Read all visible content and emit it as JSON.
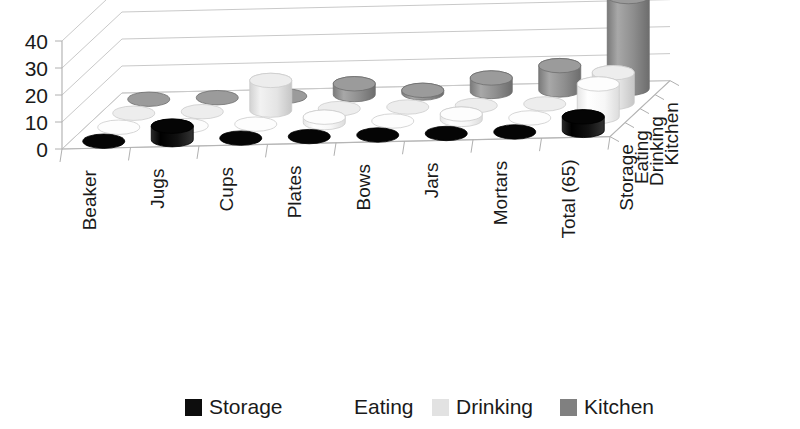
{
  "chart_data": {
    "type": "bar",
    "subtype": "3d-cylinder-grouped",
    "title": "",
    "xlabel": "",
    "ylabel": "",
    "ylim": [
      0,
      40
    ],
    "yticks": [
      0,
      10,
      20,
      30,
      40
    ],
    "grid": true,
    "legend_position": "bottom",
    "categories": [
      "Beaker",
      "Jugs",
      "Cups",
      "Plates",
      "Bows",
      "Jars",
      "Mortars",
      "Total (65)"
    ],
    "depth_categories": [
      "Storage",
      "Eating",
      "Drinking",
      "Kitchen"
    ],
    "series": [
      {
        "name": "Storage",
        "color": "#0d0d0d",
        "values": [
          0,
          5,
          0,
          0,
          0,
          0,
          0,
          5
        ]
      },
      {
        "name": "Eating",
        "color": "#fbfbfb",
        "values": [
          0,
          0,
          0,
          2,
          0,
          2,
          0,
          12
        ]
      },
      {
        "name": "Drinking",
        "color": "#e2e2e2",
        "values": [
          0,
          0,
          11,
          0,
          0,
          0,
          0,
          11
        ]
      },
      {
        "name": "Kitchen",
        "color": "#8c8c8c",
        "values": [
          0,
          0,
          0,
          4,
          1,
          5,
          9,
          34
        ]
      }
    ],
    "legend": [
      {
        "label": "Storage",
        "color": "#0d0d0d"
      },
      {
        "label": "Eating",
        "color": "#ffffff"
      },
      {
        "label": "Drinking",
        "color": "#e2e2e2"
      },
      {
        "label": "Kitchen",
        "color": "#808080"
      }
    ]
  }
}
